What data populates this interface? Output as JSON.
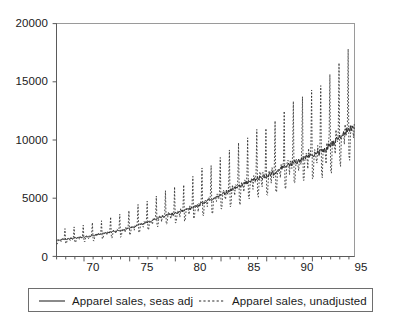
{
  "chart_data": {
    "type": "line",
    "title": "",
    "subtitle": "",
    "xlabel": "",
    "ylabel": "",
    "xlim": [
      1967.0,
      1999.6
    ],
    "ylim": [
      0,
      20000
    ],
    "grid": false,
    "frequency": "monthly",
    "y_ticks": [
      0,
      5000,
      10000,
      15000,
      20000
    ],
    "y_tick_labels": [
      "0",
      "5000",
      "10000",
      "15000",
      "20000"
    ],
    "x_ticks": [
      1970,
      1975,
      1980,
      1985,
      1990,
      1995
    ],
    "x_tick_labels": [
      "70",
      "75",
      "80",
      "85",
      "90",
      "95"
    ],
    "x_minor_tick_interval": 1,
    "legend": {
      "position": "below-plot",
      "entries": [
        {
          "label": "Apparel sales, seas adj",
          "style": "solid",
          "color": "#2b2b2b"
        },
        {
          "label": "Apparel sales, unadjusted",
          "style": "dashed",
          "color": "#2b2b2b"
        }
      ]
    },
    "series": [
      {
        "name": "Apparel sales, seas adj",
        "style": "solid",
        "color": "#2b2b2b",
        "x_start": 1967.0,
        "x_step": 0.0833333,
        "annual_trend_values": [
          1400,
          1480,
          1570,
          1650,
          1790,
          1960,
          2100,
          2230,
          2420,
          2680,
          2950,
          3250,
          3520,
          3700,
          3950,
          4200,
          4560,
          4950,
          5300,
          5650,
          6050,
          6400,
          6700,
          6950,
          7250,
          7700,
          8050,
          8400,
          8700,
          9050,
          9550,
          10200,
          10900,
          11500
        ],
        "annual_trend_years": [
          1967,
          1968,
          1969,
          1970,
          1971,
          1972,
          1973,
          1974,
          1975,
          1976,
          1977,
          1978,
          1979,
          1980,
          1981,
          1982,
          1983,
          1984,
          1985,
          1986,
          1987,
          1988,
          1989,
          1990,
          1991,
          1992,
          1993,
          1994,
          1995,
          1996,
          1997,
          1998,
          1999,
          2000
        ]
      },
      {
        "name": "Apparel sales, unadjusted",
        "style": "dashed",
        "color": "#2b2b2b",
        "x_start": 1967.0,
        "x_step": 0.0833333,
        "seasonal_factors": [
          0.78,
          0.76,
          0.95,
          1.03,
          1.02,
          0.97,
          0.9,
          1.05,
          1.0,
          0.98,
          1.08,
          1.62
        ],
        "december_peak_values": [
          2180,
          2320,
          2470,
          2620,
          2880,
          3180,
          3450,
          3680,
          4020,
          4480,
          4980,
          5520,
          6020,
          6350,
          6820,
          7300,
          7980,
          8700,
          9350,
          10000,
          10750,
          11400,
          11950,
          12450,
          13050,
          13900,
          14600,
          15250,
          15800,
          16450,
          16800
        ],
        "december_peak_years": [
          1967,
          1968,
          1969,
          1970,
          1971,
          1972,
          1973,
          1974,
          1975,
          1976,
          1977,
          1978,
          1979,
          1980,
          1981,
          1982,
          1983,
          1984,
          1985,
          1986,
          1987,
          1988,
          1989,
          1990,
          1991,
          1992,
          1993,
          1994,
          1995,
          1996,
          1997
        ],
        "january_trough_values": [
          1060,
          1120,
          1190,
          1250,
          1360,
          1490,
          1600,
          1700,
          1850,
          2050,
          2260,
          2490,
          2700,
          2840,
          3030,
          3220,
          3500,
          3800,
          4070,
          4340,
          4650,
          4920,
          5150,
          5350,
          5580,
          5930,
          6200,
          6470,
          6700,
          6970,
          7350,
          7850,
          8400
        ]
      }
    ]
  },
  "axes": {
    "y_labels": [
      "20000",
      "15000",
      "10000",
      "5000",
      "0"
    ],
    "x_labels": [
      "70",
      "75",
      "80",
      "85",
      "90",
      "95"
    ]
  },
  "legend": {
    "entry_1": "Apparel sales, seas adj",
    "entry_2": "Apparel sales, unadjusted"
  }
}
